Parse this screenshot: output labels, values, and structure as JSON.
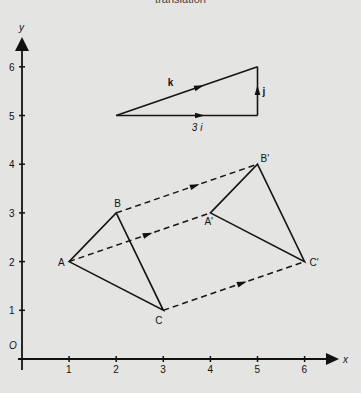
{
  "caption": "translation",
  "axes": {
    "x_label": "x",
    "y_label": "y",
    "origin_label": "O",
    "x_ticks": [
      "1",
      "2",
      "3",
      "4",
      "5",
      "6"
    ],
    "y_ticks": [
      "1",
      "2",
      "3",
      "4",
      "5",
      "6"
    ],
    "x_range": [
      0,
      6.7
    ],
    "y_range": [
      0,
      6.7
    ]
  },
  "vector_triangle": {
    "start": [
      2,
      5
    ],
    "corner": [
      5,
      5
    ],
    "end": [
      5,
      6
    ],
    "labels": {
      "k": "k",
      "j": "j",
      "i": "3 i"
    }
  },
  "triangle_original": {
    "A": {
      "label": "A",
      "point": [
        1,
        2
      ]
    },
    "B": {
      "label": "B",
      "point": [
        2,
        3
      ]
    },
    "C": {
      "label": "C",
      "point": [
        3,
        1
      ]
    }
  },
  "triangle_image": {
    "A": {
      "label": "A'",
      "point": [
        4,
        3
      ]
    },
    "B": {
      "label": "B'",
      "point": [
        5,
        4
      ]
    },
    "C": {
      "label": "C'",
      "point": [
        6,
        2
      ]
    }
  },
  "translation_vector": [
    3,
    1
  ]
}
